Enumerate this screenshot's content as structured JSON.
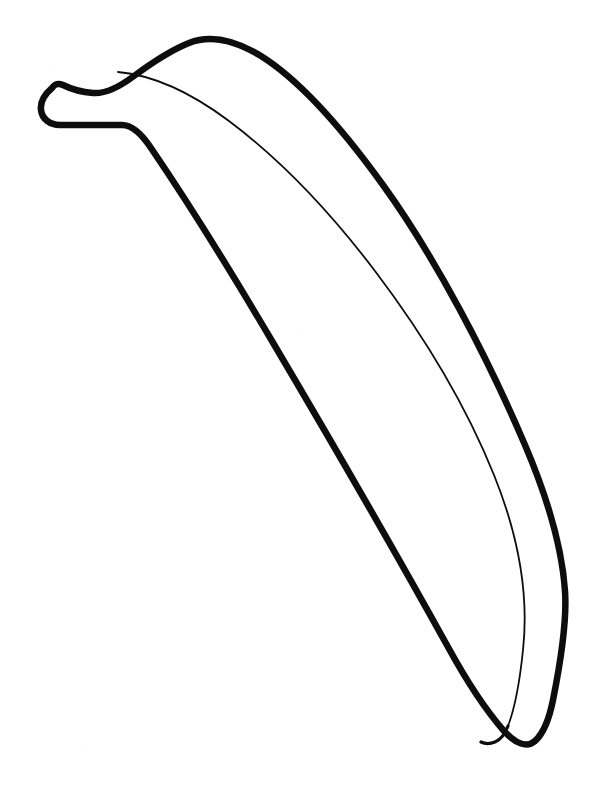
{
  "document": {
    "title": "Banana Coloring Page",
    "kind": "line-art-coloring-page",
    "subject": "banana",
    "width": 593,
    "height": 795,
    "background_color": "#ffffff",
    "ink_color": "#0d0d0d"
  },
  "artwork": {
    "name": "banana-outline",
    "description": "Single banana drawn in black outline on white, stem at upper left, body curving down to a tip at lower right",
    "stroke_color": "#0d0d0d",
    "fill_color": "none",
    "strokes": {
      "outer_outline_width": 6.5,
      "inner_detail_width": 1.8,
      "linecap": "round",
      "linejoin": "round"
    },
    "paths": {
      "outer_outline": "M 52 88 C 44 95 40 103 41 110 C 42 119 50 124 60 124 L 123 124 C 133 124 142 132 152 147 C 186 197 226 262 272 340 C 330 438 396 554 447 646 C 470 688 489 714 503 730 C 515 744 526 748 534 742 C 543 735 548 722 552 702 C 560 662 566 620 564 592 C 561 548 547 500 524 446 C 486 357 434 258 382 186 C 338 125 295 79 260 57 C 232 40 208 36 188 44 C 170 51 152 63 133 77 C 117 89 104 95 92 94 C 80 93 70 90 62 86 C 57 84 54 85 52 88 Z",
      "stem_underside": "M 60 124 L 123 124 C 133 124 142 132 152 147",
      "inner_ridge": "M 118 73 C 150 76 188 92 228 122 C 276 158 327 210 374 272 C 424 338 466 409 493 476 C 518 538 528 596 522 651 C 518 690 512 714 507 727",
      "tip_inner": "M 507 727 C 503 735 499 740 494 742"
    },
    "key_points": {
      "stem_tip_left": [
        40,
        105
      ],
      "stem_top_shoulder": [
        92,
        94
      ],
      "stem_bottom_corner": [
        128,
        124
      ],
      "top_apex": [
        205,
        43
      ],
      "right_max": [
        566,
        640
      ],
      "bottom_tip": [
        512,
        746
      ],
      "left_outline_mid": [
        310,
        380
      ],
      "inner_line_origin": [
        118,
        73
      ]
    }
  },
  "labels": {
    "page_caption": ""
  }
}
